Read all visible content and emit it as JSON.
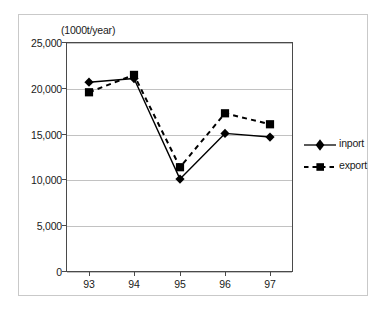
{
  "chart_data": {
    "type": "line",
    "title": "",
    "subtitle": "",
    "unit_label": "(1000t/year)",
    "xlabel": "",
    "ylabel": "",
    "categories": [
      "93",
      "94",
      "95",
      "96",
      "97"
    ],
    "series": [
      {
        "name": "inport",
        "marker": "filled-diamond",
        "line_style": "solid",
        "color": "#000000",
        "values": [
          20600,
          21000,
          10000,
          15000,
          14600
        ]
      },
      {
        "name": "export",
        "marker": "filled-square",
        "line_style": "dashed",
        "color": "#000000",
        "values": [
          19500,
          21400,
          11300,
          17200,
          16000
        ]
      }
    ],
    "ylim": [
      0,
      25000
    ],
    "ytick_values": [
      0,
      5000,
      10000,
      15000,
      20000,
      25000
    ],
    "ytick_labels": [
      "0",
      "5,000",
      "10,000",
      "15,000",
      "20,000",
      "25,000"
    ],
    "xtick_labels": [
      "93",
      "94",
      "95",
      "96",
      "97"
    ],
    "grid": {
      "horizontal": true,
      "vertical": false
    },
    "legend": {
      "position": "right",
      "entries": [
        {
          "label": "inport",
          "marker": "filled-diamond",
          "line_style": "solid"
        },
        {
          "label": "export",
          "marker": "filled-square",
          "line_style": "dashed"
        }
      ]
    },
    "colors": {
      "axis": "#4a4a4a",
      "gridline": "#c2c2c2",
      "series": "#000000",
      "frame": "#c9c9c9",
      "background": "#ffffff"
    }
  }
}
